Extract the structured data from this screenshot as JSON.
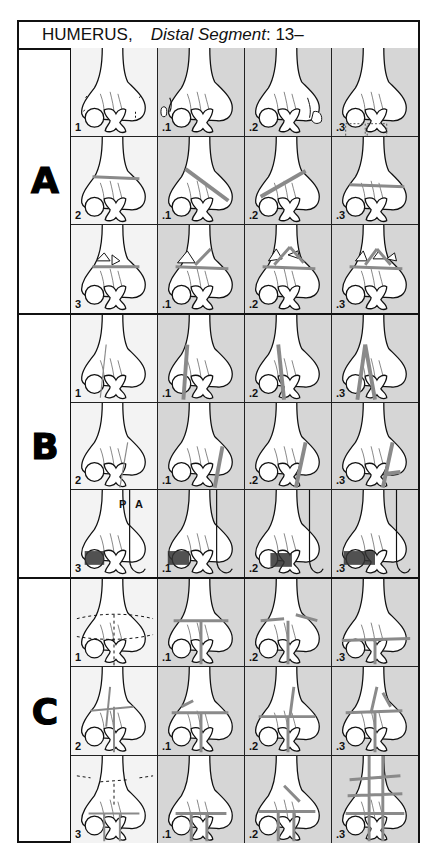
{
  "header": {
    "bone": "HUMERUS,",
    "segment_label": "Distal Segment",
    "code": ": 13–"
  },
  "colors": {
    "base_cell": "#f3f3f3",
    "subgroup_cell": "#d6d6d6",
    "fracture_line": "#8a8a8a",
    "outline": "#111111"
  },
  "groups": [
    {
      "letter": "A",
      "rows": [
        {
          "cells": [
            {
              "label": "1",
              "type": "a-avulsion",
              "base": true
            },
            {
              "label": ".1",
              "type": "a-avulsion-lat",
              "base": false
            },
            {
              "label": ".2",
              "type": "a-avulsion-med",
              "base": false
            },
            {
              "label": ".3",
              "type": "a-avulsion-incarc",
              "base": false
            }
          ]
        },
        {
          "cells": [
            {
              "label": "2",
              "type": "a-simple",
              "base": true
            },
            {
              "label": ".1",
              "type": "a-simple-oblique-down",
              "base": false
            },
            {
              "label": ".2",
              "type": "a-simple-oblique-up",
              "base": false
            },
            {
              "label": ".3",
              "type": "a-simple-transverse",
              "base": false
            }
          ]
        },
        {
          "cells": [
            {
              "label": "3",
              "type": "a-multi",
              "base": true
            },
            {
              "label": ".1",
              "type": "a-wedge-lat",
              "base": false
            },
            {
              "label": ".2",
              "type": "a-wedge-med",
              "base": false
            },
            {
              "label": ".3",
              "type": "a-complex",
              "base": false
            }
          ]
        }
      ]
    },
    {
      "letter": "B",
      "rows": [
        {
          "cells": [
            {
              "label": "1",
              "type": "b-lat-sagittal",
              "base": true
            },
            {
              "label": ".1",
              "type": "b-lat-sagittal-1",
              "base": false
            },
            {
              "label": ".2",
              "type": "b-lat-sagittal-2",
              "base": false
            },
            {
              "label": ".3",
              "type": "b-lat-sagittal-3",
              "base": false
            }
          ]
        },
        {
          "cells": [
            {
              "label": "2",
              "type": "b-med-sagittal",
              "base": true
            },
            {
              "label": ".1",
              "type": "b-med-sagittal-1",
              "base": false
            },
            {
              "label": ".2",
              "type": "b-med-sagittal-2",
              "base": false
            },
            {
              "label": ".3",
              "type": "b-med-sagittal-3",
              "base": false
            }
          ]
        },
        {
          "cells": [
            {
              "label": "3",
              "type": "b-frontal",
              "base": true,
              "view_labels": [
                "P",
                "A"
              ]
            },
            {
              "label": ".1",
              "type": "b-frontal-1",
              "base": false
            },
            {
              "label": ".2",
              "type": "b-frontal-2",
              "base": false
            },
            {
              "label": ".3",
              "type": "b-frontal-3",
              "base": false
            }
          ]
        }
      ]
    },
    {
      "letter": "C",
      "rows": [
        {
          "cells": [
            {
              "label": "1",
              "type": "c-simple",
              "base": true
            },
            {
              "label": ".1",
              "type": "c-simple-1",
              "base": false
            },
            {
              "label": ".2",
              "type": "c-simple-2",
              "base": false
            },
            {
              "label": ".3",
              "type": "c-simple-3",
              "base": false
            }
          ]
        },
        {
          "cells": [
            {
              "label": "2",
              "type": "c-meta-multi",
              "base": true
            },
            {
              "label": ".1",
              "type": "c-meta-multi-1",
              "base": false
            },
            {
              "label": ".2",
              "type": "c-meta-multi-2",
              "base": false
            },
            {
              "label": ".3",
              "type": "c-meta-multi-3",
              "base": false
            }
          ]
        },
        {
          "cells": [
            {
              "label": "3",
              "type": "c-art-multi",
              "base": true
            },
            {
              "label": ".1",
              "type": "c-art-multi-1",
              "base": false
            },
            {
              "label": ".2",
              "type": "c-art-multi-2",
              "base": false
            },
            {
              "label": ".3",
              "type": "c-art-multi-3",
              "base": false
            }
          ]
        }
      ]
    }
  ]
}
